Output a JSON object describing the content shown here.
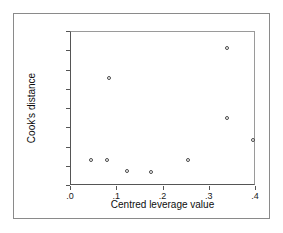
{
  "chart_data": {
    "type": "scatter",
    "title": "",
    "xlabel": "Centred leverage value",
    "ylabel": "Cook's distance",
    "xlim": [
      0.0,
      0.4
    ],
    "ylim": [
      -0.1,
      0.7
    ],
    "xticks": [
      0.0,
      0.1,
      0.2,
      0.3,
      0.4
    ],
    "xtick_labels": [
      ".0",
      ".1",
      ".2",
      ".3",
      ".4"
    ],
    "yticks": [
      -0.1,
      0.0,
      0.1,
      0.2,
      0.3,
      0.4,
      0.5,
      0.6,
      0.7
    ],
    "ytick_labels": [
      "-.1",
      ".0",
      ".1",
      ".2",
      ".3",
      ".4",
      ".5",
      ".6",
      ".7"
    ],
    "grid": false,
    "legend": null,
    "marker": "open-circle",
    "marker_color": "#4a4a4a",
    "points": [
      {
        "x": 0.043,
        "y": 0.033
      },
      {
        "x": 0.078,
        "y": 0.033
      },
      {
        "x": 0.082,
        "y": 0.46
      },
      {
        "x": 0.121,
        "y": -0.02
      },
      {
        "x": 0.173,
        "y": -0.025
      },
      {
        "x": 0.253,
        "y": 0.033
      },
      {
        "x": 0.337,
        "y": 0.617
      },
      {
        "x": 0.337,
        "y": 0.253
      },
      {
        "x": 0.393,
        "y": 0.14
      }
    ]
  }
}
